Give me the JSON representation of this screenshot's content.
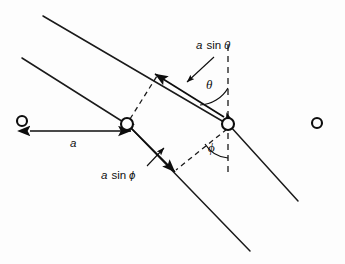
{
  "figure": {
    "background_color": "#fdfdfd",
    "ink_color": "#111111",
    "width": 345,
    "height": 264
  },
  "labels": {
    "spacing": {
      "text_a": "a",
      "full": "a"
    },
    "path_out": {
      "quantity": "a",
      "function": "sin",
      "angle": "θ",
      "full": "a sin θ"
    },
    "path_in": {
      "quantity": "a",
      "function": "sin",
      "angle": "ϕ",
      "full": "a sin ϕ"
    },
    "angle_theta": "θ",
    "angle_phi": "ϕ"
  },
  "atoms": [
    {
      "name": "atom-far-left",
      "cx": 22,
      "cy": 121,
      "r": 5.2,
      "filled_ring": false
    },
    {
      "name": "atom-scatterer-left",
      "cx": 127,
      "cy": 124,
      "r": 6.2,
      "filled_ring": true
    },
    {
      "name": "atom-scatterer-right",
      "cx": 228,
      "cy": 124,
      "r": 6.2,
      "filled_ring": true
    },
    {
      "name": "atom-far-right",
      "cx": 317,
      "cy": 123,
      "r": 5.2,
      "filled_ring": false
    }
  ],
  "wavefront_lines": [
    {
      "name": "incident-wavefront-upper",
      "x1": 43,
      "y1": 16,
      "x2": 228,
      "y2": 124
    },
    {
      "name": "incident-wavefront-lower",
      "x1": 22,
      "y1": 58,
      "x2": 127,
      "y2": 124
    },
    {
      "name": "scattered-wavefront-upper",
      "x1": 228,
      "y1": 124,
      "x2": 298,
      "y2": 201
    },
    {
      "name": "scattered-wavefront-lower",
      "x1": 127,
      "y1": 124,
      "x2": 250,
      "y2": 251
    }
  ],
  "construction_lines": [
    {
      "name": "perpendicular-upper",
      "x1": 129,
      "y1": 119,
      "x2": 157,
      "y2": 76
    },
    {
      "name": "perpendicular-lower",
      "x1": 228,
      "y1": 128,
      "x2": 176,
      "y2": 170
    }
  ],
  "normals": [
    {
      "name": "surface-normal-dashed",
      "x1": 228,
      "y1": 45,
      "x2": 228,
      "y2": 176
    }
  ],
  "measure_arrows": [
    {
      "name": "spacing-a-arrow",
      "x1": 28,
      "y1": 131,
      "x2": 133,
      "y2": 131,
      "double_headed": true,
      "label_x": 73,
      "label_y": 143
    },
    {
      "name": "path-difference-theta-arrow",
      "x1": 226,
      "y1": 118,
      "x2": 153,
      "y2": 73,
      "double_headed": true
    },
    {
      "name": "path-difference-phi-arrow",
      "x1": 129,
      "y1": 126,
      "x2": 177,
      "y2": 174,
      "double_headed": true
    }
  ],
  "leaders": [
    {
      "name": "leader-a-sin-theta",
      "x1": 213,
      "y1": 58,
      "x2": 186,
      "y2": 83
    },
    {
      "name": "leader-a-sin-phi",
      "x1": 148,
      "y1": 165,
      "x2": 163,
      "y2": 149
    }
  ],
  "angle_marks": [
    {
      "name": "theta-arc",
      "label": "θ",
      "label_x": 211,
      "label_y": 86,
      "vertex_x": 228,
      "vertex_y": 120
    },
    {
      "name": "phi-arc",
      "label": "ϕ",
      "label_x": 213,
      "label_y": 149,
      "vertex_x": 228,
      "vertex_y": 128
    }
  ],
  "text_positions": {
    "a_sin_theta": {
      "x": 196,
      "y": 46
    },
    "a_sin_phi": {
      "x": 101,
      "y": 176
    },
    "a": {
      "x": 73,
      "y": 144
    }
  }
}
